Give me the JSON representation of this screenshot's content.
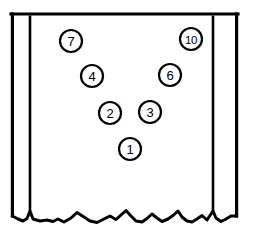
{
  "figure": {
    "type": "patent-line-drawing",
    "title": "",
    "canvas": {
      "width": 253,
      "height": 239,
      "background": "#ffffff"
    },
    "stroke_color": "#000000",
    "cropped_caption_fragment": "",
    "frame": {
      "name": "enclosure-outline",
      "top_y": 14,
      "left_x": 11,
      "right_x": 238,
      "bottom_y": 214,
      "inner_left_post_x": 30,
      "inner_right_post_x": 213
    },
    "break_line": {
      "name": "torn-break-edge",
      "description": "irregular jagged break line across bottom of figure"
    },
    "callouts": [
      {
        "id": "callout-7",
        "label": "7",
        "cx": 71,
        "cy": 41,
        "r": 11
      },
      {
        "id": "callout-10",
        "label": "10",
        "cx": 191,
        "cy": 39,
        "r": 11
      },
      {
        "id": "callout-4",
        "label": "4",
        "cx": 92,
        "cy": 76,
        "r": 11
      },
      {
        "id": "callout-6",
        "label": "6",
        "cx": 170,
        "cy": 75,
        "r": 11
      },
      {
        "id": "callout-2",
        "label": "2",
        "cx": 110,
        "cy": 113,
        "r": 11
      },
      {
        "id": "callout-3",
        "label": "3",
        "cx": 150,
        "cy": 112,
        "r": 11
      },
      {
        "id": "callout-1",
        "label": "1",
        "cx": 130,
        "cy": 149,
        "r": 11
      }
    ]
  }
}
